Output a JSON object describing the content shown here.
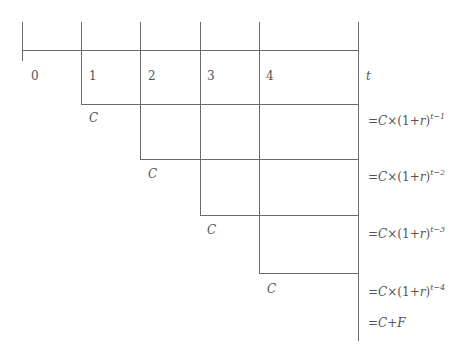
{
  "diagram": {
    "type": "cash-flow timeline",
    "period_labels": [
      "0",
      "1",
      "2",
      "3",
      "4"
    ],
    "axis_end_label": "t",
    "cash_flow_label": "C",
    "cash_flows": [
      {
        "period": "1",
        "label": "C"
      },
      {
        "period": "2",
        "label": "C"
      },
      {
        "period": "3",
        "label": "C"
      },
      {
        "period": "4",
        "label": "C"
      }
    ],
    "formulas": [
      {
        "prefix": "=",
        "C": "C",
        "times": "×",
        "base": "(1+",
        "r": "r",
        "close": ")",
        "exp": "t−1"
      },
      {
        "prefix": "=",
        "C": "C",
        "times": "×",
        "base": "(1+",
        "r": "r",
        "close": ")",
        "exp": "t−2"
      },
      {
        "prefix": "=",
        "C": "C",
        "times": "×",
        "base": "(1+",
        "r": "r",
        "close": ")",
        "exp": "t−3"
      },
      {
        "prefix": "=",
        "C": "C",
        "times": "×",
        "base": "(1+",
        "r": "r",
        "close": ")",
        "exp": "t−4"
      }
    ],
    "final_formula": {
      "prefix": "=",
      "C": "C",
      "plus": "+",
      "F": "F"
    },
    "colors": {
      "line": "#6a6a6a",
      "text": "#555555",
      "background": "#ffffff"
    }
  }
}
